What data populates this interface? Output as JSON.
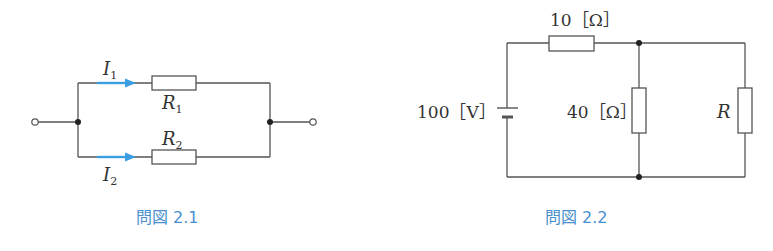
{
  "figures": [
    {
      "id": "fig-2-1",
      "caption": "問図 2.1",
      "labels": {
        "I1": "I",
        "I1_sub": "1",
        "I2": "I",
        "I2_sub": "2",
        "R1": "R",
        "R1_sub": "1",
        "R2": "R",
        "R2_sub": "2"
      },
      "description": "Two resistors R1 and R2 in parallel between two terminals, currents I1 and I2 marked with blue arrows",
      "accent_color": "#3a9ee0"
    },
    {
      "id": "fig-2-2",
      "caption": "問図 2.2",
      "labels": {
        "source": "100［V］",
        "series_resistor": "10［Ω］",
        "shunt_resistor": "40［Ω］",
        "load_resistor": "R"
      },
      "description": "100 V source with 10 Ω series resistor feeding 40 Ω and R in parallel"
    }
  ],
  "caption_color": "#4a90d0"
}
